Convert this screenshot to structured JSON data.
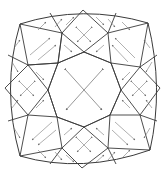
{
  "diagram": {
    "title": "",
    "colors": {
      "background": "#ffffff",
      "facet_edge": "#3a3a3a",
      "ray": "#7a7a7a"
    },
    "outline": [
      [
        20,
        24
      ],
      [
        50,
        13
      ],
      [
        83,
        10
      ],
      [
        116,
        13
      ],
      [
        148,
        23
      ],
      [
        157,
        55
      ],
      [
        160,
        88
      ],
      [
        157,
        121
      ],
      [
        150,
        150
      ],
      [
        116,
        164
      ],
      [
        82,
        168
      ],
      [
        50,
        164
      ],
      [
        20,
        156
      ],
      [
        8,
        121
      ],
      [
        5,
        88
      ],
      [
        8,
        55
      ]
    ],
    "table": [
      [
        84,
        52
      ],
      [
        111,
        63
      ],
      [
        121,
        90
      ],
      [
        110,
        115
      ],
      [
        84,
        127
      ],
      [
        57,
        117
      ],
      [
        48,
        90
      ],
      [
        58,
        63
      ]
    ],
    "ring": [
      [
        28,
        65
      ],
      [
        62,
        33
      ],
      [
        108,
        33
      ],
      [
        140,
        67
      ],
      [
        140,
        115
      ],
      [
        108,
        148
      ],
      [
        62,
        148
      ],
      [
        28,
        115
      ]
    ],
    "center_rays": "two crossing double-headed arrows in the table",
    "labels": []
  }
}
